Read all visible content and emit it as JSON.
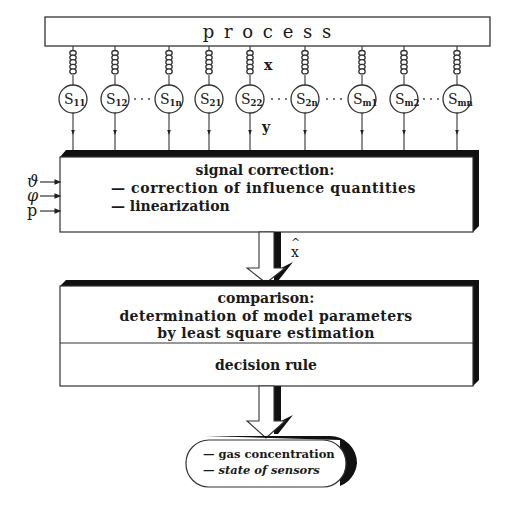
{
  "process": {
    "label": "p r o c e s s"
  },
  "signal_labels": {
    "x": "x",
    "y": "y",
    "x_hat": "x"
  },
  "sensors": [
    {
      "id": "S11",
      "base": "S",
      "sub": "11",
      "cx": 73
    },
    {
      "id": "S12",
      "base": "S",
      "sub": "12",
      "cx": 115
    },
    {
      "id": "S1n",
      "base": "S",
      "sub": "1n",
      "cx": 169
    },
    {
      "id": "S21",
      "base": "S",
      "sub": "21",
      "cx": 209
    },
    {
      "id": "S22",
      "base": "S",
      "sub": "22",
      "cx": 250
    },
    {
      "id": "S2n",
      "base": "S",
      "sub": "2n",
      "cx": 305
    },
    {
      "id": "Sm1",
      "base": "S",
      "sub": "m1",
      "cx": 362
    },
    {
      "id": "Sm2",
      "base": "S",
      "sub": "m2",
      "cx": 404
    },
    {
      "id": "Smn",
      "base": "S",
      "sub": "mn",
      "cx": 457
    }
  ],
  "inputs": [
    {
      "symbol": "ϑ"
    },
    {
      "symbol": "φ"
    },
    {
      "symbol": "p"
    }
  ],
  "signal_correction": {
    "title": "signal correction:",
    "items": [
      "— correction of influence quantities",
      "— linearization"
    ]
  },
  "comparison": {
    "title": "comparison:",
    "line1": "determination of model parameters",
    "line2": "by least square estimation",
    "decision": "decision rule"
  },
  "output": {
    "items": [
      "— gas concentration",
      "— state of sensors"
    ]
  }
}
